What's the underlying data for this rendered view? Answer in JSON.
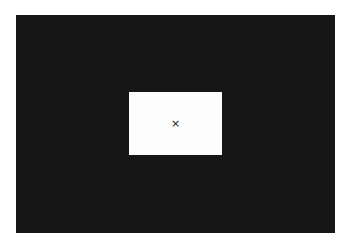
{
  "overlay": {
    "background": "#161616"
  },
  "dialog": {
    "background": "#fdfdfd",
    "close_icon": "×"
  }
}
